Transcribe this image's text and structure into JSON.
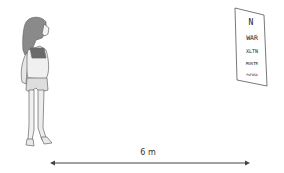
{
  "diagram": {
    "distance_label": "6 m",
    "eye_chart": {
      "rows": [
        "N",
        "WAR",
        "XLTN",
        "MUSTR",
        "PUFNSA"
      ]
    },
    "figure": "child-standing"
  }
}
